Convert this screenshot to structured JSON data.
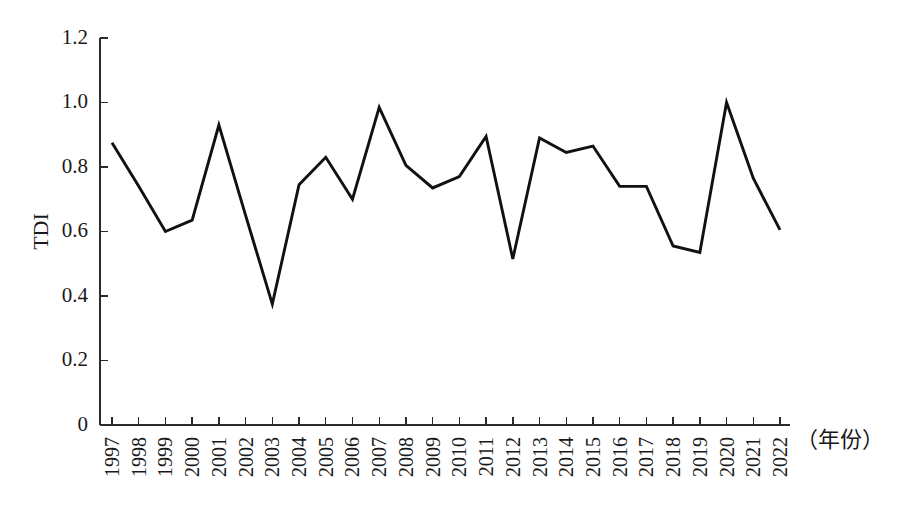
{
  "chart_data": {
    "type": "line",
    "title": "",
    "subtitle": "",
    "xlabel": "（年份）",
    "ylabel": "TDI",
    "categories": [
      "1997",
      "1998",
      "1999",
      "2000",
      "2001",
      "2002",
      "2003",
      "2004",
      "2005",
      "2006",
      "2007",
      "2008",
      "2009",
      "2010",
      "2011",
      "2012",
      "2013",
      "2014",
      "2015",
      "2016",
      "2017",
      "2018",
      "2019",
      "2020",
      "2021",
      "2022"
    ],
    "series": [
      {
        "name": "TDI",
        "values": [
          0.875,
          0.74,
          0.6,
          0.635,
          0.93,
          0.65,
          0.375,
          0.745,
          0.83,
          0.7,
          0.985,
          0.805,
          0.735,
          0.77,
          0.895,
          0.515,
          0.89,
          0.845,
          0.865,
          0.74,
          0.74,
          0.555,
          0.535,
          1.0,
          0.765,
          0.605
        ],
        "color": "#111111"
      }
    ],
    "ytick_labels": [
      "0",
      "0.2",
      "0.4",
      "0.6",
      "0.8",
      "1.0",
      "1.2"
    ],
    "ytick_values": [
      0,
      0.2,
      0.4,
      0.6,
      0.8,
      1.0,
      1.2
    ],
    "ylim": [
      0,
      1.2
    ],
    "xlim": [
      1997,
      2022
    ],
    "grid": false,
    "legend": false,
    "legend_position": "none",
    "line_color": "#111111",
    "axis_color": "#2b2b2b",
    "background_color": "#ffffff"
  },
  "layout": {
    "plot_left": 100,
    "plot_right": 790,
    "plot_top": 38,
    "plot_bottom": 425,
    "first_tick_x": 112,
    "tick_spacing": 26.72
  }
}
